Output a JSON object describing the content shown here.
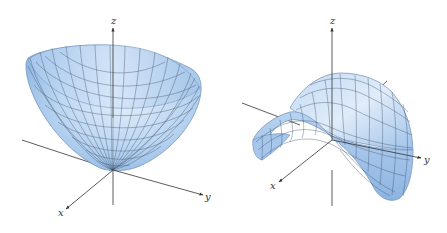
{
  "figure": {
    "panels": [
      {
        "name": "elliptic-paraboloid",
        "axes": {
          "x": "x",
          "y": "y",
          "z": "z"
        }
      },
      {
        "name": "hyperbolic-paraboloid",
        "axes": {
          "x": "x",
          "y": "y",
          "z": "z"
        }
      }
    ],
    "colors": {
      "surface_light": "#dbe9f8",
      "surface_mid": "#b4d1f0",
      "surface_dark": "#8fb6e2",
      "grid": "#3b4f66",
      "axis": "#333333"
    }
  }
}
